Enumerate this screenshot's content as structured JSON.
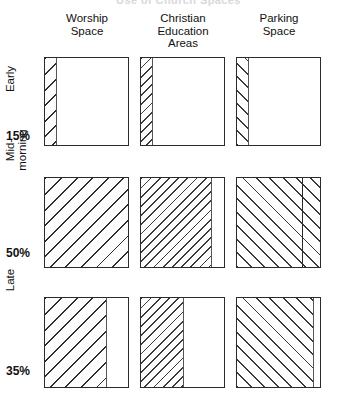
{
  "chart_title": "Use of Church Spaces",
  "columns": [
    {
      "id": "worship",
      "label_line1": "Worship",
      "label_line2": "Space",
      "label_line3": ""
    },
    {
      "id": "christian",
      "label_line1": "Christian",
      "label_line2": "Education",
      "label_line3": "Areas"
    },
    {
      "id": "parking",
      "label_line1": "Parking",
      "label_line2": "Space",
      "label_line3": ""
    }
  ],
  "rows": [
    {
      "id": "early",
      "name": "Early",
      "percent": "15%"
    },
    {
      "id": "mid-morning",
      "name": "Mid-\nmorning",
      "percent": "50%"
    },
    {
      "id": "late",
      "name": "Late",
      "percent": "35%"
    }
  ],
  "chart_data": {
    "type": "bar",
    "title": "Use of Church Spaces",
    "xlabel": "",
    "ylabel": "",
    "ylim": [
      0,
      100
    ],
    "orientation": "horizontal",
    "grid": false,
    "legend": "none",
    "categories": [
      "Worship Space",
      "Christian Education Areas",
      "Parking Space"
    ],
    "series": [
      {
        "name": "Early",
        "share_of_attendance": 15,
        "values": [
          15,
          15,
          15
        ],
        "divider": [
          null,
          null,
          null
        ]
      },
      {
        "name": "Mid-morning",
        "share_of_attendance": 50,
        "values": [
          100,
          85,
          100
        ],
        "divider": [
          null,
          null,
          78
        ]
      },
      {
        "name": "Late",
        "share_of_attendance": 35,
        "values": [
          75,
          52,
          93
        ],
        "divider": [
          null,
          null,
          null
        ]
      }
    ],
    "annotations": [
      "Each box represents the total capacity of a church space.",
      "Shaded portion shows the fraction of that space in use during the service period.",
      "Row percentages give the share of total attendance in each service period."
    ]
  },
  "cells": [
    {
      "row": "early",
      "col": "worship",
      "fill_percent": 15,
      "pattern": "hatch-heavy",
      "divider_percent": null
    },
    {
      "row": "early",
      "col": "christian",
      "fill_percent": 15,
      "pattern": "hatch-mid",
      "divider_percent": null
    },
    {
      "row": "early",
      "col": "parking",
      "fill_percent": 15,
      "pattern": "hatch-dash",
      "divider_percent": null
    },
    {
      "row": "mid-morning",
      "col": "worship",
      "fill_percent": 100,
      "pattern": "hatch-heavy",
      "divider_percent": null
    },
    {
      "row": "mid-morning",
      "col": "christian",
      "fill_percent": 85,
      "pattern": "hatch-mid",
      "divider_percent": null
    },
    {
      "row": "mid-morning",
      "col": "parking",
      "fill_percent": 100,
      "pattern": "hatch-dash",
      "divider_percent": 78
    },
    {
      "row": "late",
      "col": "worship",
      "fill_percent": 75,
      "pattern": "hatch-heavy",
      "divider_percent": null
    },
    {
      "row": "late",
      "col": "christian",
      "fill_percent": 52,
      "pattern": "hatch-mid",
      "divider_percent": null
    },
    {
      "row": "late",
      "col": "parking",
      "fill_percent": 93,
      "pattern": "hatch-dash",
      "divider_percent": null
    }
  ],
  "colors": {
    "box_border": "#2b2b2b",
    "hatch_ink": "#2e2e2e",
    "background": "#ffffff",
    "text": "#111111"
  }
}
